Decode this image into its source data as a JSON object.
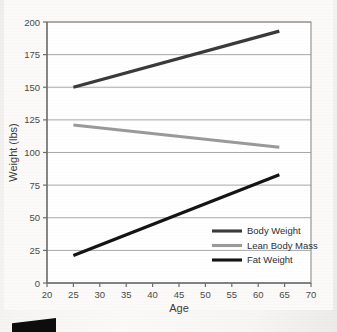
{
  "chart_data": {
    "type": "line",
    "title": "",
    "xlabel": "Age",
    "ylabel": "Weight (lbs)",
    "xlim": [
      20,
      70
    ],
    "ylim": [
      0,
      200
    ],
    "xticks": [
      20,
      25,
      30,
      35,
      40,
      45,
      50,
      55,
      60,
      65,
      70
    ],
    "yticks": [
      0,
      25,
      50,
      75,
      100,
      125,
      150,
      175,
      200
    ],
    "grid": "horizontal",
    "legend_position": "lower-right-inside",
    "series": [
      {
        "name": "Body Weight",
        "color": "#3a3a3a",
        "width": 3.2,
        "x": [
          25,
          64
        ],
        "y": [
          150,
          193
        ]
      },
      {
        "name": "Lean Body Mass",
        "color": "#9a9a9a",
        "width": 3.0,
        "x": [
          25,
          64
        ],
        "y": [
          121,
          104
        ]
      },
      {
        "name": "Fat Weight",
        "color": "#141414",
        "width": 3.2,
        "x": [
          25,
          64
        ],
        "y": [
          21,
          83
        ]
      }
    ]
  },
  "axes": {
    "xlabel": "Age",
    "ylabel": "Weight (lbs)",
    "xtick_labels": [
      "20",
      "25",
      "30",
      "35",
      "40",
      "45",
      "50",
      "55",
      "60",
      "65",
      "70"
    ],
    "ytick_labels": [
      "0",
      "25",
      "50",
      "75",
      "100",
      "125",
      "150",
      "175",
      "200"
    ]
  },
  "legend": {
    "items": [
      {
        "label": "Body Weight",
        "color": "#3a3a3a"
      },
      {
        "label": "Lean Body Mass",
        "color": "#9a9a9a"
      },
      {
        "label": "Fat Weight",
        "color": "#141414"
      }
    ]
  },
  "colors": {
    "page_background": "#efeeec",
    "plot_background": "#ffffff",
    "grid": "#9e9e9e",
    "frame": "#8e8e8e",
    "axis": "#6e6e6e",
    "tick_text": "#4a4a4a",
    "scan_artifact": "#0d0d0d"
  }
}
